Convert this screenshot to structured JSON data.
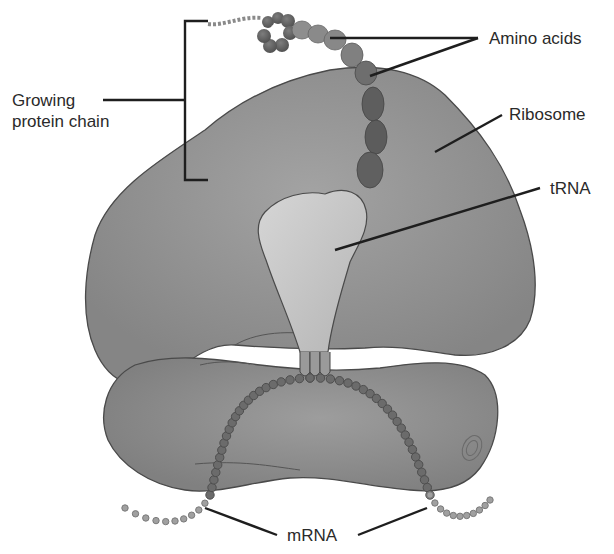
{
  "diagram": {
    "labels": {
      "growing_chain_line1": "Growing",
      "growing_chain_line2": "protein chain",
      "amino_acids": "Amino acids",
      "ribosome": "Ribosome",
      "trna": "tRNA",
      "mrna": "mRNA"
    },
    "colors": {
      "background": "#ffffff",
      "ribosome_large": "#8f8f8f",
      "ribosome_small": "#8a8a8a",
      "ribosome_outline": "#4a4a4a",
      "trna": "#c9c9c9",
      "amino_acid_dark": "#5e5e5e",
      "amino_acid_light": "#8c8c8c",
      "mrna_bead": "#6b6b6b",
      "leader_line": "#1e1e1e",
      "text": "#2a2a2a"
    }
  }
}
